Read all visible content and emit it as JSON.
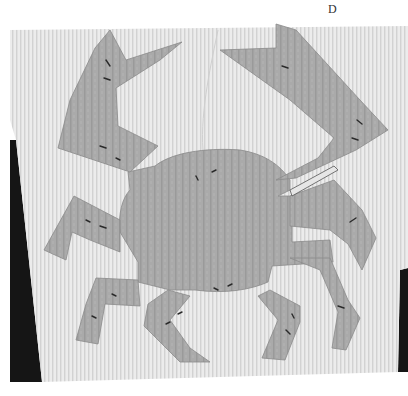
{
  "figure": {
    "label": "D",
    "colors": {
      "page": "#ffffff",
      "cloth": "#e9e9e9",
      "cloth_stripe": "#d4d4d4",
      "applique": "#a9a9a9",
      "applique_stripe": "#999999",
      "background_dark": "#1a1a1a",
      "pin": "#333333"
    }
  }
}
